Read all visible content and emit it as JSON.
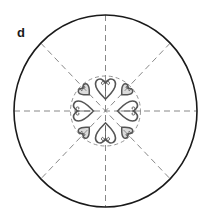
{
  "panel": {
    "label": "d"
  },
  "diagram": {
    "outer_circle": {
      "cx": 105.5,
      "cy": 111,
      "rx": 91.5,
      "ry": 96,
      "stroke": "#1a1a1a",
      "stroke_width": 1.6
    },
    "inner_circle": {
      "cx": 105.5,
      "cy": 111,
      "r": 35,
      "stroke": "#888888",
      "dashed": true
    },
    "radial_lines": {
      "count": 8,
      "angles_deg": [
        0,
        45,
        90,
        135,
        180,
        225,
        270,
        315
      ],
      "stroke": "#7a7a7a",
      "dashed": true
    },
    "ornaments": [
      {
        "name": "heart-top",
        "angle_deg": 270,
        "size": "large"
      },
      {
        "name": "heart-top-right",
        "angle_deg": 315,
        "size": "small"
      },
      {
        "name": "heart-right",
        "angle_deg": 0,
        "size": "large"
      },
      {
        "name": "heart-bottom-right",
        "angle_deg": 45,
        "size": "small"
      },
      {
        "name": "heart-bottom",
        "angle_deg": 90,
        "size": "large"
      },
      {
        "name": "heart-bottom-left",
        "angle_deg": 135,
        "size": "small"
      },
      {
        "name": "heart-left",
        "angle_deg": 180,
        "size": "large"
      },
      {
        "name": "heart-top-left",
        "angle_deg": 225,
        "size": "small"
      }
    ],
    "ornament_color": "#555555"
  }
}
